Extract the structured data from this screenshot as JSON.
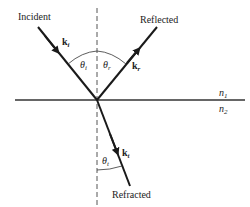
{
  "labels": {
    "incident": "Incident",
    "reflected": "Reflected",
    "refracted": "Refracted"
  },
  "vectors": {
    "incident": {
      "symbol": "k",
      "subscript": "i"
    },
    "reflected": {
      "symbol": "k",
      "subscript": "r"
    },
    "refracted": {
      "symbol": "k",
      "subscript": "t"
    }
  },
  "angles": {
    "incident": {
      "symbol": "θ",
      "subscript": "i"
    },
    "reflected": {
      "symbol": "θ",
      "subscript": "r"
    },
    "refracted": {
      "symbol": "θ",
      "subscript": "t"
    }
  },
  "media": {
    "upper": {
      "symbol": "n",
      "subscript": "1"
    },
    "lower": {
      "symbol": "n",
      "subscript": "2"
    }
  },
  "colors": {
    "ray": "#1a1a1a",
    "interface": "#333333",
    "normal": "#555555",
    "text": "#222222"
  }
}
